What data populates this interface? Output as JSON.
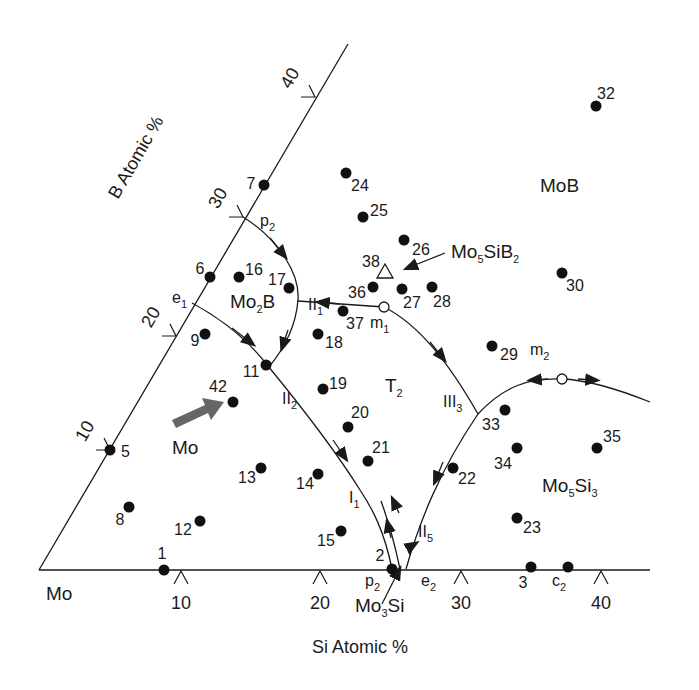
{
  "figure": {
    "type": "ternary-phase-diagram-section",
    "system": "Mo-Si-B",
    "corner_label": "Mo",
    "x_axis": {
      "title": "Si Atomic %",
      "ticks": [
        {
          "value": "10",
          "x": 181
        },
        {
          "value": "20",
          "x": 320
        },
        {
          "value": "30",
          "x": 461
        },
        {
          "value": "40",
          "x": 601
        }
      ]
    },
    "y_axis": {
      "title": "B Atomic %",
      "ticks": [
        {
          "value": "10",
          "x": 110,
          "y": 450
        },
        {
          "value": "20",
          "x": 176,
          "y": 336
        },
        {
          "value": "30",
          "x": 243,
          "y": 217
        },
        {
          "value": "40",
          "x": 315,
          "y": 97
        }
      ]
    },
    "phase_regions": [
      {
        "name": "MoB",
        "label": "MoB",
        "x": 540,
        "y": 192
      },
      {
        "name": "Mo2B",
        "base": "Mo",
        "sub": "2",
        "tail": "B",
        "x": 230,
        "y": 308
      },
      {
        "name": "T2",
        "base": "T",
        "sub": "2",
        "tail": "",
        "x": 385,
        "y": 392
      },
      {
        "name": "Mo5Si3",
        "base": "Mo",
        "sub": "5",
        "tail": "Si",
        "sub2": "3",
        "x": 542,
        "y": 492
      },
      {
        "name": "Mo",
        "label": "Mo",
        "x": 172,
        "y": 454
      },
      {
        "name": "Mo5SiB2",
        "base": "Mo",
        "sub": "5",
        "tail": "SiB",
        "sub2": "2",
        "x": 451,
        "y": 258
      },
      {
        "name": "Mo3Si",
        "base": "Mo",
        "sub": "3",
        "tail": "Si",
        "x": 355,
        "y": 612
      }
    ],
    "invariant_labels": [
      {
        "name": "e1",
        "base": "e",
        "sub": "1",
        "x": 172,
        "y": 303
      },
      {
        "name": "p2-top",
        "base": "p",
        "sub": "2",
        "x": 260,
        "y": 226
      },
      {
        "name": "p2-bottom",
        "base": "p",
        "sub": "2",
        "x": 365,
        "y": 586
      },
      {
        "name": "e2",
        "base": "e",
        "sub": "2",
        "x": 421,
        "y": 586
      },
      {
        "name": "c2",
        "base": "c",
        "sub": "2",
        "x": 552,
        "y": 586
      },
      {
        "name": "m1",
        "base": "m",
        "sub": "1",
        "x": 370,
        "y": 328
      },
      {
        "name": "m2",
        "base": "m",
        "sub": "2",
        "x": 530,
        "y": 355
      },
      {
        "name": "II1",
        "base": "II",
        "sub": "1",
        "x": 308,
        "y": 310
      },
      {
        "name": "II2",
        "base": "II",
        "sub": "2",
        "x": 282,
        "y": 404
      },
      {
        "name": "I1",
        "base": "I",
        "sub": "1",
        "x": 349,
        "y": 503
      },
      {
        "name": "III3",
        "base": "III",
        "sub": "3",
        "x": 443,
        "y": 407
      },
      {
        "name": "II5",
        "base": "II",
        "sub": "5",
        "x": 418,
        "y": 537
      }
    ],
    "samples": [
      {
        "id": "1",
        "x": 164,
        "y": 570,
        "lx": 162,
        "ly": 559,
        "anchor": "middle"
      },
      {
        "id": "2",
        "x": 392,
        "y": 569,
        "lx": 380,
        "ly": 561,
        "anchor": "middle"
      },
      {
        "id": "3",
        "x": 531,
        "y": 567,
        "lx": 523,
        "ly": 588,
        "anchor": "middle"
      },
      {
        "id": "5",
        "x": 110,
        "y": 450,
        "lx": 121,
        "ly": 457,
        "anchor": "start"
      },
      {
        "id": "6",
        "x": 210,
        "y": 277,
        "lx": 200,
        "ly": 274,
        "anchor": "middle"
      },
      {
        "id": "7",
        "x": 264,
        "y": 185,
        "lx": 251,
        "ly": 189,
        "anchor": "middle"
      },
      {
        "id": "8",
        "x": 129,
        "y": 507,
        "lx": 120,
        "ly": 525,
        "anchor": "middle"
      },
      {
        "id": "9",
        "x": 205,
        "y": 334,
        "lx": 195,
        "ly": 346,
        "anchor": "middle"
      },
      {
        "id": "11",
        "x": 266,
        "y": 365,
        "lx": 251,
        "ly": 377,
        "anchor": "middle"
      },
      {
        "id": "12",
        "x": 200,
        "y": 521,
        "lx": 183,
        "ly": 535,
        "anchor": "middle"
      },
      {
        "id": "13",
        "x": 261,
        "y": 468,
        "lx": 247,
        "ly": 483,
        "anchor": "middle"
      },
      {
        "id": "14",
        "x": 318,
        "y": 474,
        "lx": 305,
        "ly": 489,
        "anchor": "middle"
      },
      {
        "id": "15",
        "x": 341,
        "y": 531,
        "lx": 326,
        "ly": 546,
        "anchor": "middle"
      },
      {
        "id": "16",
        "x": 239,
        "y": 277,
        "lx": 245,
        "ly": 275,
        "anchor": "start"
      },
      {
        "id": "17",
        "x": 289,
        "y": 288,
        "lx": 277,
        "ly": 285,
        "anchor": "middle"
      },
      {
        "id": "18",
        "x": 318,
        "y": 334,
        "lx": 325,
        "ly": 348,
        "anchor": "start"
      },
      {
        "id": "19",
        "x": 323,
        "y": 389,
        "lx": 329,
        "ly": 389,
        "anchor": "start"
      },
      {
        "id": "20",
        "x": 348,
        "y": 427,
        "lx": 351,
        "ly": 418,
        "anchor": "start"
      },
      {
        "id": "21",
        "x": 368,
        "y": 461,
        "lx": 372,
        "ly": 453,
        "anchor": "start"
      },
      {
        "id": "22",
        "x": 453,
        "y": 468,
        "lx": 458,
        "ly": 484,
        "anchor": "start"
      },
      {
        "id": "23",
        "x": 517,
        "y": 518,
        "lx": 523,
        "ly": 533,
        "anchor": "start"
      },
      {
        "id": "24",
        "x": 346,
        "y": 173,
        "lx": 351,
        "ly": 191,
        "anchor": "start"
      },
      {
        "id": "25",
        "x": 363,
        "y": 217,
        "lx": 370,
        "ly": 216,
        "anchor": "start"
      },
      {
        "id": "26",
        "x": 404,
        "y": 240,
        "lx": 412,
        "ly": 255,
        "anchor": "start"
      },
      {
        "id": "27",
        "x": 402,
        "y": 289,
        "lx": 403,
        "ly": 308,
        "anchor": "start"
      },
      {
        "id": "28",
        "x": 432,
        "y": 287,
        "lx": 433,
        "ly": 307,
        "anchor": "start"
      },
      {
        "id": "29",
        "x": 492,
        "y": 346,
        "lx": 500,
        "ly": 360,
        "anchor": "start"
      },
      {
        "id": "30",
        "x": 562,
        "y": 273,
        "lx": 566,
        "ly": 291,
        "anchor": "start"
      },
      {
        "id": "32",
        "x": 596,
        "y": 106,
        "lx": 597,
        "ly": 99,
        "anchor": "start"
      },
      {
        "id": "33",
        "x": 505,
        "y": 410,
        "lx": 482,
        "ly": 430,
        "anchor": "start"
      },
      {
        "id": "34",
        "x": 517,
        "y": 448,
        "lx": 494,
        "ly": 469,
        "anchor": "start"
      },
      {
        "id": "35",
        "x": 597,
        "y": 448,
        "lx": 603,
        "ly": 442,
        "anchor": "start"
      },
      {
        "id": "36",
        "x": 373,
        "y": 287,
        "lx": 348,
        "ly": 298,
        "anchor": "start"
      },
      {
        "id": "37",
        "x": 343,
        "y": 311,
        "lx": 346,
        "ly": 329,
        "anchor": "start"
      },
      {
        "id": "42",
        "x": 233,
        "y": 402,
        "lx": 209,
        "ly": 392,
        "anchor": "start"
      },
      {
        "id": "c2",
        "x": 568,
        "y": 567,
        "lx": null,
        "ly": null,
        "anchor": "start"
      }
    ],
    "special_points": {
      "m1": {
        "x": 384,
        "y": 307,
        "kind": "open-circle"
      },
      "m2": {
        "x": 562,
        "y": 379,
        "kind": "open-circle"
      },
      "sample_38": {
        "id": "38",
        "x": 385,
        "y": 272,
        "lx": 362,
        "ly": 267,
        "kind": "open-triangle"
      }
    },
    "arrows": {
      "mo5sib2_pointer": {
        "from": [
          445,
          253
        ],
        "to": [
          408,
          268
        ]
      },
      "mo3si_pointer": {
        "from": [
          382,
          604
        ],
        "to": [
          400,
          568
        ]
      },
      "mo_bold_arrow": {
        "from": [
          175,
          425
        ],
        "to": [
          222,
          403
        ],
        "color": "#666666"
      }
    },
    "colors": {
      "ink": "#1a1a1a",
      "background": "#ffffff",
      "bold_arrow": "#666666"
    }
  }
}
